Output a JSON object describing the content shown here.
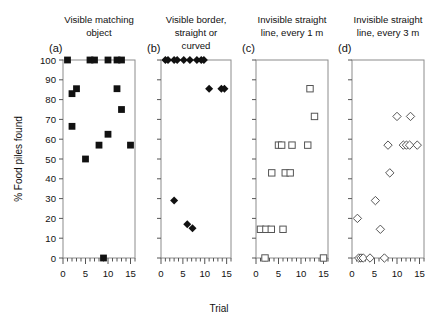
{
  "figure": {
    "y_axis_label": "% Food piles found",
    "x_axis_label": "Trial",
    "y_ticks": [
      "0",
      "10",
      "20",
      "30",
      "40",
      "50",
      "60",
      "70",
      "80",
      "90",
      "100"
    ],
    "y_tick_values": [
      0,
      10,
      20,
      30,
      40,
      50,
      60,
      70,
      80,
      90,
      100
    ],
    "x_ticks": [
      "0",
      "5",
      "10",
      "15"
    ],
    "x_tick_values": [
      0,
      5,
      10,
      15
    ],
    "xlim": [
      0,
      16
    ],
    "ylim": [
      0,
      100
    ]
  },
  "chart_data": [
    {
      "type": "scatter",
      "panel": "a",
      "panel_label": "(a)",
      "title": "Visible matching object",
      "title_lines": [
        "Visible matching",
        "object"
      ],
      "marker": "filled-square",
      "xlabel": "Trial",
      "ylabel": "% Food piles found",
      "xlim": [
        0,
        16
      ],
      "ylim": [
        0,
        100
      ],
      "grid": false,
      "points": [
        {
          "x": 1,
          "y": 100
        },
        {
          "x": 2,
          "y": 83
        },
        {
          "x": 3,
          "y": 85.5
        },
        {
          "x": 2,
          "y": 66.5
        },
        {
          "x": 5,
          "y": 50
        },
        {
          "x": 6,
          "y": 100
        },
        {
          "x": 7,
          "y": 100
        },
        {
          "x": 8,
          "y": 57
        },
        {
          "x": 9,
          "y": 0
        },
        {
          "x": 10,
          "y": 100
        },
        {
          "x": 10,
          "y": 62.5
        },
        {
          "x": 12,
          "y": 85.5
        },
        {
          "x": 12,
          "y": 100
        },
        {
          "x": 13,
          "y": 100
        },
        {
          "x": 13,
          "y": 75
        },
        {
          "x": 15,
          "y": 57
        }
      ]
    },
    {
      "type": "scatter",
      "panel": "b",
      "panel_label": "(b)",
      "title": "Visible border, straight or curved",
      "title_lines": [
        "Visible border,",
        "straight or",
        "curved"
      ],
      "marker": "filled-diamond",
      "xlabel": "Trial",
      "ylabel": "% Food piles found",
      "xlim": [
        0,
        16
      ],
      "ylim": [
        0,
        100
      ],
      "grid": false,
      "points": [
        {
          "x": 1,
          "y": 100
        },
        {
          "x": 1.6,
          "y": 100
        },
        {
          "x": 3,
          "y": 100
        },
        {
          "x": 3.7,
          "y": 100
        },
        {
          "x": 5.2,
          "y": 100
        },
        {
          "x": 6.6,
          "y": 100
        },
        {
          "x": 8.2,
          "y": 100
        },
        {
          "x": 9.2,
          "y": 100
        },
        {
          "x": 9.8,
          "y": 100
        },
        {
          "x": 11,
          "y": 85.5
        },
        {
          "x": 13.8,
          "y": 85.5
        },
        {
          "x": 14.5,
          "y": 85.5
        },
        {
          "x": 3,
          "y": 29
        },
        {
          "x": 6,
          "y": 17
        },
        {
          "x": 7.2,
          "y": 15
        }
      ]
    },
    {
      "type": "scatter",
      "panel": "c",
      "panel_label": "(c)",
      "title": "Invisible straight line, every 1 m",
      "title_lines": [
        "Invisible straight",
        "line, every 1 m"
      ],
      "marker": "open-square",
      "xlabel": "Trial",
      "ylabel": "% Food piles found",
      "xlim": [
        0,
        16
      ],
      "ylim": [
        0,
        100
      ],
      "grid": false,
      "points": [
        {
          "x": 12,
          "y": 85.5
        },
        {
          "x": 13,
          "y": 71.5
        },
        {
          "x": 5,
          "y": 57
        },
        {
          "x": 5.7,
          "y": 57
        },
        {
          "x": 8,
          "y": 57
        },
        {
          "x": 11.5,
          "y": 57
        },
        {
          "x": 3.5,
          "y": 43
        },
        {
          "x": 6.5,
          "y": 43
        },
        {
          "x": 7.6,
          "y": 43
        },
        {
          "x": 1,
          "y": 14.5
        },
        {
          "x": 2.2,
          "y": 14.5
        },
        {
          "x": 3.4,
          "y": 14.5
        },
        {
          "x": 6,
          "y": 14.5
        },
        {
          "x": 2,
          "y": 0
        },
        {
          "x": 15,
          "y": 0
        }
      ]
    },
    {
      "type": "scatter",
      "panel": "d",
      "panel_label": "(d)",
      "title": "Invisible straight line, every 3 m",
      "title_lines": [
        "Invisible straight",
        "line, every 3 m"
      ],
      "marker": "open-diamond",
      "xlabel": "Trial",
      "ylabel": "% Food piles found",
      "xlim": [
        0,
        16
      ],
      "ylim": [
        0,
        100
      ],
      "grid": false,
      "points": [
        {
          "x": 10,
          "y": 71.5
        },
        {
          "x": 13,
          "y": 71.5
        },
        {
          "x": 8,
          "y": 57
        },
        {
          "x": 11.4,
          "y": 57
        },
        {
          "x": 12.1,
          "y": 57
        },
        {
          "x": 12.8,
          "y": 57
        },
        {
          "x": 14.5,
          "y": 57
        },
        {
          "x": 8.4,
          "y": 43
        },
        {
          "x": 5.2,
          "y": 29
        },
        {
          "x": 1.2,
          "y": 20
        },
        {
          "x": 6.3,
          "y": 14.5
        },
        {
          "x": 1.5,
          "y": 0
        },
        {
          "x": 2.0,
          "y": 0
        },
        {
          "x": 2.5,
          "y": 0
        },
        {
          "x": 4.0,
          "y": 0
        },
        {
          "x": 7.2,
          "y": 0
        }
      ]
    }
  ]
}
